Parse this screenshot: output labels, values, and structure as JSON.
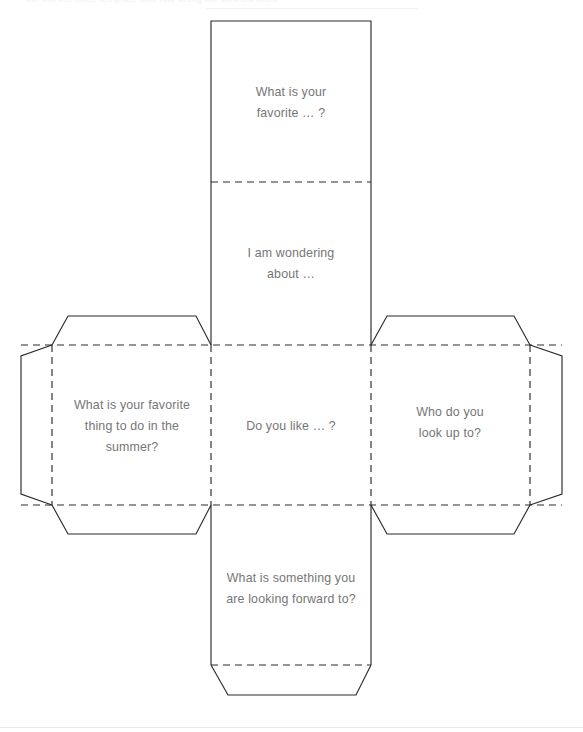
{
  "document": {
    "title": "Question Cube Net Template",
    "page_background": "#ffffff",
    "ink_color": "#2b2b2b",
    "text_color": "#767676",
    "header_ghost_text": "cut out the cube template and fold along the dashed lines"
  },
  "net": {
    "shape": "cube-net-cross",
    "column_x": [
      211,
      371
    ],
    "row_y": [
      21,
      182,
      345,
      505,
      665
    ],
    "left_panel_x": [
      52,
      211
    ],
    "right_panel_x": [
      371,
      530
    ],
    "glue_tab_outer_left_x": 21,
    "glue_tab_outer_right_x": 562,
    "bottom_tab_y": 695
  },
  "panels": [
    {
      "id": "panel-top",
      "position": "top",
      "lines": [
        "What is your",
        "favorite … ?"
      ],
      "text": "What is your favorite … ?"
    },
    {
      "id": "panel-upper-middle",
      "position": "upper-middle",
      "lines": [
        "I am wondering",
        "about …"
      ],
      "text": "I am wondering about …"
    },
    {
      "id": "panel-left",
      "position": "left",
      "lines": [
        "What is your favorite",
        "thing to do in the",
        "summer?"
      ],
      "text": "What is your favorite thing to do in the summer?"
    },
    {
      "id": "panel-center",
      "position": "center",
      "lines": [
        "Do you like … ?"
      ],
      "text": "Do you like … ?"
    },
    {
      "id": "panel-right",
      "position": "right",
      "lines": [
        "Who do you",
        "look up to?"
      ],
      "text": "Who do you look up to?"
    },
    {
      "id": "panel-bottom",
      "position": "bottom",
      "lines": [
        "What is something you",
        "are looking forward to?"
      ],
      "text": "What is something you are looking forward to?"
    }
  ],
  "tabs": [
    {
      "id": "tab-left-top",
      "label": ""
    },
    {
      "id": "tab-left-outer",
      "label": ""
    },
    {
      "id": "tab-left-bottom",
      "label": ""
    },
    {
      "id": "tab-right-top",
      "label": ""
    },
    {
      "id": "tab-right-outer",
      "label": ""
    },
    {
      "id": "tab-right-bottom",
      "label": ""
    },
    {
      "id": "tab-bottom",
      "label": ""
    }
  ]
}
